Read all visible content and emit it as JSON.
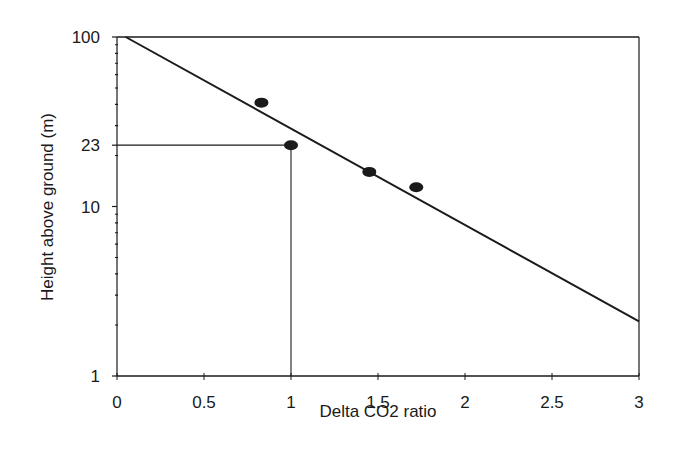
{
  "chart_data": {
    "type": "scatter",
    "title": "",
    "xlabel": "Delta CO2 ratio",
    "ylabel": "Height above ground (m)",
    "xlim": [
      0,
      3
    ],
    "ylim": [
      1,
      100
    ],
    "yscale": "log",
    "grid": false,
    "legend": null,
    "x_ticks": [
      0,
      0.5,
      1,
      1.5,
      2,
      2.5,
      3
    ],
    "x_tick_labels": [
      "0",
      "0.5",
      "1",
      "1.5",
      "2",
      "2.5",
      "3"
    ],
    "y_ticks": [
      1,
      10,
      23,
      100
    ],
    "y_tick_labels": [
      "1",
      "10",
      "23",
      "100"
    ],
    "series": [
      {
        "name": "Observations",
        "type": "scatter",
        "marker": "filled-ellipse",
        "color": "#1a1a1a",
        "points": [
          {
            "x": 0.83,
            "y": 41
          },
          {
            "x": 1.0,
            "y": 23
          },
          {
            "x": 1.45,
            "y": 16
          },
          {
            "x": 1.72,
            "y": 13
          }
        ]
      },
      {
        "name": "Fitted line",
        "type": "line",
        "color": "#1a1a1a",
        "points": [
          {
            "x": 0.05,
            "y": 100
          },
          {
            "x": 3.0,
            "y": 2.1
          }
        ]
      }
    ],
    "annotations": [
      {
        "type": "hline",
        "y": 23,
        "x_from": 0,
        "x_to": 1.0,
        "description": "reference line at 23 m"
      },
      {
        "type": "vline",
        "x": 1.0,
        "y_from": 1,
        "y_to": 23,
        "description": "reference line at ratio 1"
      }
    ]
  },
  "labels": {
    "xlabel": "Delta CO2 ratio",
    "ylabel": "Height above ground (m)",
    "x_ticks": [
      "0",
      "0.5",
      "1",
      "1.5",
      "2",
      "2.5",
      "3"
    ],
    "y_ticks": [
      "100",
      "23",
      "10",
      "1"
    ]
  }
}
